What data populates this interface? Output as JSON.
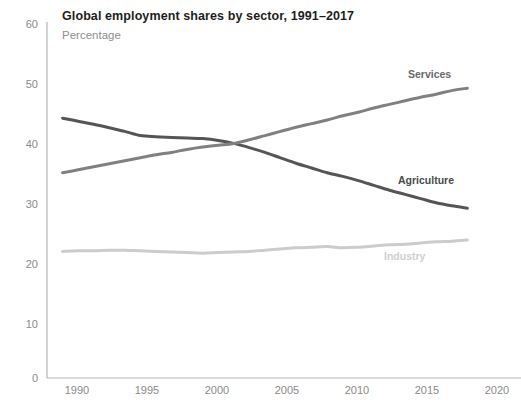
{
  "chart_data": {
    "type": "line",
    "title": "Global employment shares by sector, 1991–2017",
    "subtitle": "Percentage",
    "xlabel": "",
    "ylabel": "",
    "xlim": [
      1990,
      2020
    ],
    "ylim": [
      0,
      60
    ],
    "grid": false,
    "legend_position": "inline-right",
    "x_ticks": [
      "1990",
      "1995",
      "2000",
      "2005",
      "2010",
      "2015",
      "2020"
    ],
    "y_ticks": [
      "0",
      "10",
      "20",
      "30",
      "40",
      "50",
      "60"
    ],
    "x": [
      1991,
      1992,
      1993,
      1994,
      1995,
      1996,
      1997,
      1998,
      1999,
      2000,
      2001,
      2002,
      2003,
      2004,
      2005,
      2006,
      2007,
      2008,
      2009,
      2010,
      2011,
      2012,
      2013,
      2014,
      2015,
      2016,
      2017
    ],
    "series": [
      {
        "name": "Agriculture",
        "color": "#555555",
        "values": [
          43.3,
          42.8,
          42.3,
          41.7,
          41.1,
          40.4,
          40.2,
          40.1,
          40.0,
          39.9,
          39.6,
          39.1,
          38.4,
          37.6,
          36.7,
          35.8,
          35.0,
          34.2,
          33.6,
          32.9,
          32.1,
          31.3,
          30.6,
          29.9,
          29.2,
          28.7,
          28.3
        ],
        "label_position": {
          "x": 398,
          "y": 174
        }
      },
      {
        "name": "Services",
        "color": "#808080",
        "values": [
          34.2,
          34.7,
          35.2,
          35.7,
          36.2,
          36.7,
          37.2,
          37.6,
          38.1,
          38.5,
          38.8,
          39.1,
          39.7,
          40.4,
          41.1,
          41.8,
          42.4,
          43.0,
          43.7,
          44.3,
          45.0,
          45.6,
          46.2,
          46.8,
          47.3,
          47.9,
          48.3
        ],
        "label_position": {
          "x": 408,
          "y": 68
        }
      },
      {
        "name": "Industry",
        "color": "#cccccc",
        "values": [
          21.1,
          21.2,
          21.2,
          21.3,
          21.3,
          21.2,
          21.1,
          21.0,
          20.9,
          20.8,
          20.9,
          21.0,
          21.1,
          21.3,
          21.5,
          21.7,
          21.8,
          21.9,
          21.7,
          21.8,
          22.0,
          22.2,
          22.3,
          22.5,
          22.7,
          22.8,
          23.0
        ],
        "label_position": {
          "x": 384,
          "y": 250
        }
      }
    ]
  },
  "axes": {
    "y_ticks": [
      {
        "label": "60",
        "top": 18
      },
      {
        "label": "50",
        "top": 78
      },
      {
        "label": "40",
        "top": 138
      },
      {
        "label": "30",
        "top": 198
      },
      {
        "label": "20",
        "top": 258
      },
      {
        "label": "10",
        "top": 318
      },
      {
        "label": "0",
        "top": 372
      }
    ],
    "x_ticks": [
      {
        "label": "1990",
        "left": 54
      },
      {
        "label": "1995",
        "left": 124
      },
      {
        "label": "2000",
        "left": 194
      },
      {
        "label": "2005",
        "left": 264
      },
      {
        "label": "2010",
        "left": 334
      },
      {
        "label": "2015",
        "left": 404
      },
      {
        "label": "2020",
        "left": 474
      }
    ]
  }
}
